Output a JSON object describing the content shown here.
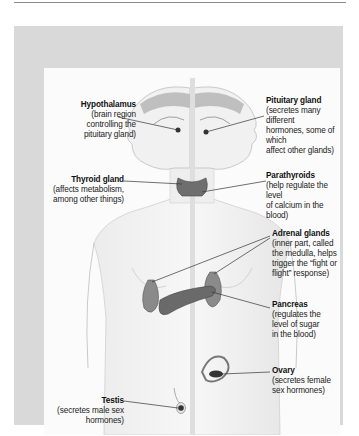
{
  "figure": {
    "frame_color": "#d9d9d9",
    "panel_color": "#fbfbfb",
    "gland_color": "#6e6e6e",
    "line_color": "#333333"
  },
  "labels": {
    "hypothalamus": {
      "title": "Hypothalamus",
      "lines": [
        "(brain region",
        "controlling the",
        "pituitary gland)"
      ]
    },
    "pituitary": {
      "title": "Pituitary gland",
      "lines": [
        "(secretes many different",
        "hormones, some of which",
        "affect other glands)"
      ]
    },
    "thyroid": {
      "title": "Thyroid gland",
      "lines": [
        "(affects metabolism,",
        "among other things)"
      ]
    },
    "parathyroids": {
      "title": "Parathyroids",
      "lines": [
        "(help regulate the level",
        "of calcium in the blood)"
      ]
    },
    "adrenal": {
      "title": "Adrenal glands",
      "lines": [
        "(inner part, called",
        "the medulla, helps",
        "trigger the “fight or",
        "flight” response)"
      ]
    },
    "pancreas": {
      "title": "Pancreas",
      "lines": [
        "(regulates the",
        "level of sugar",
        "in the blood)"
      ]
    },
    "ovary": {
      "title": "Ovary",
      "lines": [
        "(secretes female",
        "sex hormones)"
      ]
    },
    "testis": {
      "title": "Testis",
      "lines": [
        "(secretes male sex",
        "hormones)"
      ]
    }
  }
}
